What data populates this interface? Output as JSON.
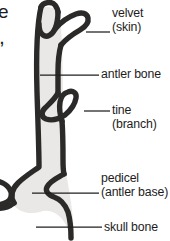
{
  "figure": {
    "background_color": "#ffffff",
    "outline_color": "#2b2a28",
    "fill_color": "#e9e8e6",
    "leader_line_color": "#1f1f1f",
    "text_color": "#1d1d1d"
  },
  "edge_artifacts": {
    "letter": "e",
    "comma": ","
  },
  "labels": [
    {
      "id": "velvet",
      "line1": "velvet",
      "line2": "(skin)",
      "leader": {
        "x1": 86,
        "y1": 32,
        "x2": 110,
        "y2": 32
      }
    },
    {
      "id": "antler-bone",
      "line1": "antler bone",
      "line2": "",
      "leader": {
        "x1": 40,
        "y1": 75,
        "x2": 99,
        "y2": 75
      }
    },
    {
      "id": "tine",
      "line1": "tine",
      "line2": "(branch)",
      "leader": {
        "x1": 84,
        "y1": 111,
        "x2": 110,
        "y2": 111
      }
    },
    {
      "id": "pedicel",
      "line1": "pedicel",
      "line2": "(antler base)",
      "leader": {
        "x1": 32,
        "y1": 193,
        "x2": 99,
        "y2": 193
      }
    },
    {
      "id": "skull-bone",
      "line1": "skull bone",
      "line2": "",
      "leader": {
        "x1": 36,
        "y1": 227,
        "x2": 102,
        "y2": 227
      }
    }
  ]
}
